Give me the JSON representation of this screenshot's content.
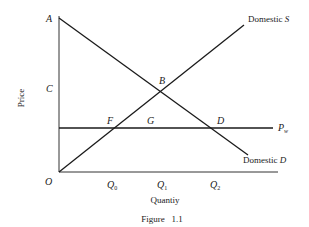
{
  "figure": {
    "caption": "Figure   1.1",
    "axes": {
      "ylabel": "Price",
      "xlabel": "Quantiy",
      "origin": "O"
    },
    "price_labels": {
      "A": "A",
      "C": "C"
    },
    "points": {
      "B": "B",
      "F": "F",
      "G": "G",
      "D": "D"
    },
    "quantity_ticks": {
      "q0": "Q",
      "q0_sub": "0",
      "q1": "Q",
      "q1_sub": "1",
      "q2": "Q",
      "q2_sub": "2"
    },
    "curves": {
      "supply_prefix": "Domestic ",
      "supply_letter": "S",
      "demand_prefix": "Domestic ",
      "demand_letter": "D",
      "world_price": "P",
      "world_price_sub": "w"
    }
  }
}
